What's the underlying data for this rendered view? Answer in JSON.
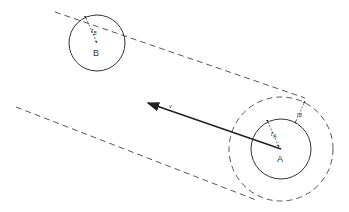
{
  "diagram": {
    "title": "",
    "colors": {
      "stroke": "#333333",
      "background": "#ffffff"
    },
    "labels": {
      "body_a": "A",
      "body_b": "B",
      "radius_a": "r",
      "radius_a_sub": "A",
      "radius_b": "r",
      "radius_b_sub": "B",
      "radius_b_ext": "r",
      "radius_b_ext_sub": "B",
      "velocity": "v"
    },
    "circles": [
      {
        "name": "body-b",
        "cx": 97,
        "cy": 43,
        "r": 28,
        "style": "solid"
      },
      {
        "name": "body-a",
        "cx": 281,
        "cy": 149,
        "r": 30,
        "style": "solid"
      },
      {
        "name": "collision-radius-a",
        "cx": 281,
        "cy": 149,
        "r": 52,
        "style": "dashed"
      }
    ],
    "lines": [
      {
        "name": "collision-tube-upper",
        "x1": 55,
        "y1": 12,
        "x2": 305,
        "y2": 98,
        "style": "dashed"
      },
      {
        "name": "collision-tube-lower",
        "x1": 16,
        "y1": 107,
        "x2": 256,
        "y2": 200,
        "style": "dashed"
      }
    ],
    "arrow": {
      "name": "velocity-vector",
      "x1": 281,
      "y1": 149,
      "x2": 146,
      "y2": 102
    }
  }
}
